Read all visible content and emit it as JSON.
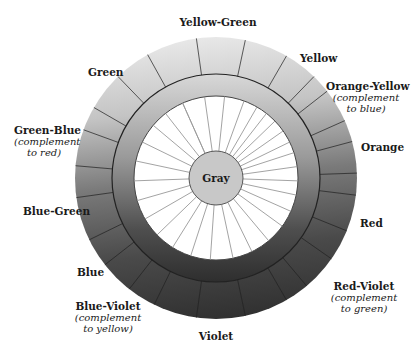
{
  "diagram": {
    "type": "color-wheel",
    "center_label": "Gray",
    "labels": {
      "yellow_green": {
        "name": "Yellow-Green"
      },
      "yellow": {
        "name": "Yellow"
      },
      "orange_yellow": {
        "name": "Orange-Yellow",
        "note": "(complement to blue)",
        "note_l1": "(complement",
        "note_l2": "to blue)"
      },
      "orange": {
        "name": "Orange"
      },
      "red": {
        "name": "Red"
      },
      "red_violet": {
        "name": "Red-Violet",
        "note_l1": "(complement",
        "note_l2": "to green)"
      },
      "violet": {
        "name": "Violet"
      },
      "blue_violet": {
        "name": "Blue-Violet",
        "note_l1": "(complement",
        "note_l2": "to yellow)"
      },
      "blue": {
        "name": "Blue"
      },
      "blue_green": {
        "name": "Blue-Green"
      },
      "green_blue": {
        "name": "Green-Blue",
        "note_l1": "(complement",
        "note_l2": "to red)"
      },
      "green": {
        "name": "Green"
      }
    },
    "geometry": {
      "cx": 216,
      "cy": 178,
      "outer_r": 141,
      "mid_r": 104,
      "inner_r": 82,
      "core_r": 27
    },
    "outer_ticks_deg": [
      -8,
      12,
      30,
      44,
      52,
      66,
      75,
      88,
      97,
      112,
      125,
      140,
      150,
      168,
      188,
      206,
      218,
      232,
      244,
      262,
      275,
      290,
      300,
      316,
      331
    ],
    "inner_spokes_deg": [
      -24,
      -8,
      6,
      20,
      30,
      38,
      46,
      55,
      64,
      72,
      82,
      92,
      102,
      114,
      126,
      140,
      154,
      168,
      184,
      198,
      212,
      226,
      240,
      254,
      268,
      282,
      296,
      310,
      322,
      336
    ],
    "colors": {
      "light": "#e6e6e6",
      "dark": "#333333",
      "core": "#c8c8c8",
      "stroke": "#222222",
      "spoke": "#999999"
    }
  }
}
